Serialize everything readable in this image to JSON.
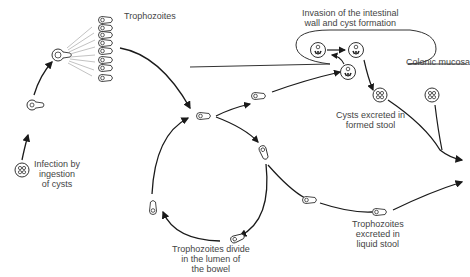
{
  "diagram": {
    "labels": {
      "trophozoites": "Trophozoites",
      "infection": [
        "Infection by",
        "ingestion",
        "of cysts"
      ],
      "invasion": [
        "Invasion of the intestinal",
        "wall and cyst formation"
      ],
      "colonic_mucosa": "Colonic mucosa",
      "cysts_excreted": [
        "Cysts excreted in",
        "formed stool"
      ],
      "troph_divide": [
        "Trophozoites divide",
        "in the lumen of",
        "the bowel"
      ],
      "troph_excreted": [
        "Trophozoites",
        "excreted in",
        "liquid stool"
      ]
    },
    "colors": {
      "line": "#1a1a1a",
      "text": "#444444"
    }
  }
}
